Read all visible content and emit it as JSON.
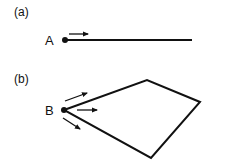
{
  "panels": [
    {
      "label": "(a)",
      "point_label": "A",
      "shape": "line-segment",
      "arrows": 1
    },
    {
      "label": "(b)",
      "point_label": "B",
      "shape": "quadrilateral",
      "arrows": 3
    }
  ],
  "colors": {
    "stroke": "#111111",
    "background": "#ffffff"
  }
}
